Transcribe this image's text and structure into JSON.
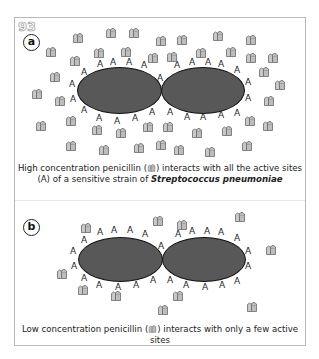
{
  "figure_number": "93",
  "panels": [
    {
      "label": "a",
      "caption_part1": "High concentration penicillin (",
      "caption_part2": ") interacts with all the active sites",
      "caption_line2_prefix": "(A) of a sensitive strain of ",
      "caption_species": "Streptococcus pneumoniae",
      "site_letter": "A",
      "concentration": "high",
      "bound_sites": "all"
    },
    {
      "label": "b",
      "caption_part1": "Low concentration penicillin (",
      "caption_part2": ") interacts with only a few active",
      "caption_line2": "sites",
      "site_letter": "A",
      "concentration": "low",
      "bound_sites": "few"
    }
  ],
  "colors": {
    "cell_fill": "#585858",
    "cell_outline": "#111111",
    "penicillin_fill": "#c4c4c4",
    "penicillin_outline": "#6a6a6a",
    "frame": "#b8b8b8"
  },
  "icons": {
    "penicillin": "penicillin-molecule-icon",
    "active_site": "active-site-A"
  }
}
